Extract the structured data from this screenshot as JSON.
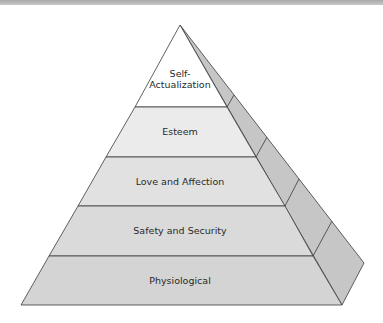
{
  "diagram": {
    "type": "pyramid",
    "levels": [
      {
        "label_line1": "Self-",
        "label_line2": "Actualization",
        "fill": "#ffffff"
      },
      {
        "label": "Esteem",
        "fill": "#ebebeb"
      },
      {
        "label": "Love and Affection",
        "fill": "#e1e1e1"
      },
      {
        "label": "Safety and Security",
        "fill": "#dadada"
      },
      {
        "label": "Physiological",
        "fill": "#d4d4d4"
      }
    ],
    "side_fill": "#c6c6c6",
    "edge_color": "#3a3a3a"
  }
}
